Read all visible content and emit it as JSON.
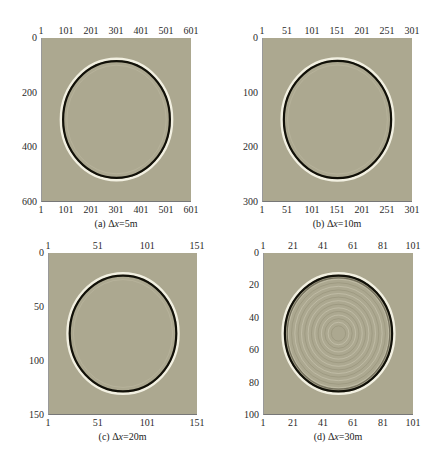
{
  "figure": {
    "background_color": "#aca890",
    "ring_dark_color": "#111008",
    "ring_light_color": "#f6f3e6"
  },
  "chart_data": [
    {
      "type": "heatmap",
      "title": "(a) Δx=5m",
      "caption_prefix": "(a) Δ",
      "caption_var": "x",
      "caption_suffix": "=5m",
      "xticks_top": [
        "1",
        "101",
        "201",
        "301",
        "401",
        "501",
        "601"
      ],
      "xticks_bottom": [
        "1",
        "101",
        "201",
        "301",
        "401",
        "501",
        "601"
      ],
      "yticks": [
        "0",
        "200",
        "400",
        "600"
      ],
      "xlim": [
        1,
        601
      ],
      "ylim": [
        0,
        600
      ],
      "wavefront": {
        "center_x": 301,
        "center_y": 300,
        "radius": 215,
        "interior_ripples": false
      }
    },
    {
      "type": "heatmap",
      "title": "(b) Δx=10m",
      "caption_prefix": "(b) Δ",
      "caption_var": "x",
      "caption_suffix": "=10m",
      "xticks_top": [
        "1",
        "51",
        "101",
        "151",
        "201",
        "251",
        "301"
      ],
      "xticks_bottom": [
        "1",
        "51",
        "101",
        "151",
        "201",
        "251",
        "301"
      ],
      "yticks": [
        "0",
        "100",
        "200",
        "300"
      ],
      "xlim": [
        1,
        301
      ],
      "ylim": [
        0,
        300
      ],
      "wavefront": {
        "center_x": 151,
        "center_y": 150,
        "radius": 108,
        "interior_ripples": false
      }
    },
    {
      "type": "heatmap",
      "title": "(c) Δx=20m",
      "caption_prefix": "(c) Δ",
      "caption_var": "x",
      "caption_suffix": "=20m",
      "xticks_top": [
        "1",
        "51",
        "101",
        "151"
      ],
      "xticks_bottom": [
        "1",
        "51",
        "101",
        "151"
      ],
      "yticks": [
        "0",
        "50",
        "100",
        "150"
      ],
      "xlim": [
        1,
        151
      ],
      "ylim": [
        0,
        150
      ],
      "wavefront": {
        "center_x": 76,
        "center_y": 75,
        "radius": 54,
        "interior_ripples": false
      }
    },
    {
      "type": "heatmap",
      "title": "(d) Δx=30m",
      "caption_prefix": "(d) Δ",
      "caption_var": "x",
      "caption_suffix": "=30m",
      "xticks_top": [
        "1",
        "21",
        "41",
        "61",
        "81",
        "101"
      ],
      "xticks_bottom": [
        "1",
        "21",
        "41",
        "61",
        "81",
        "101"
      ],
      "yticks": [
        "0",
        "20",
        "40",
        "60",
        "80",
        "100"
      ],
      "xlim": [
        1,
        101
      ],
      "ylim": [
        0,
        100
      ],
      "wavefront": {
        "center_x": 51,
        "center_y": 50,
        "radius": 36,
        "interior_ripples": true
      }
    }
  ]
}
